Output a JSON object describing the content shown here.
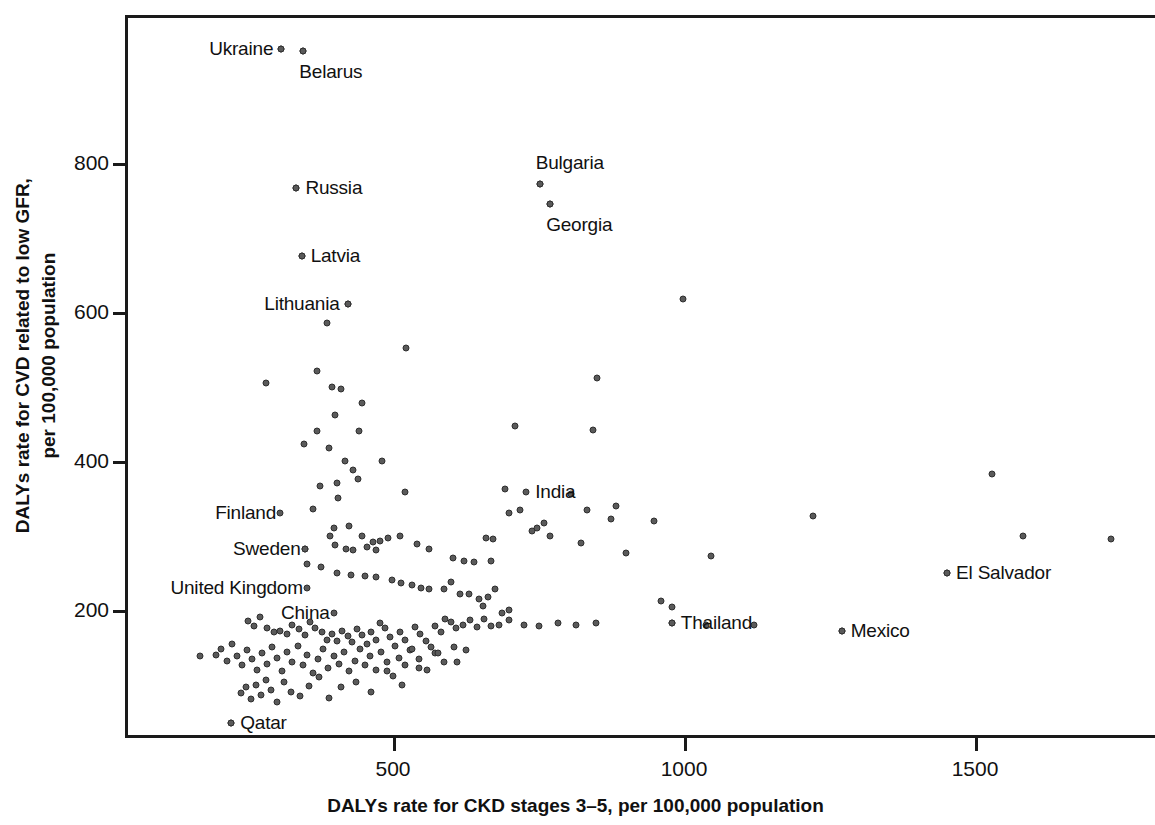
{
  "chart_data": {
    "type": "scatter",
    "title": "",
    "xlabel": "DALYs rate for CKD stages 3–5, per 100,000 population",
    "ylabel": "DALYs rate for CVD related to low GFR,\nper 100,000 population",
    "ylabel_line1": "DALYs rate for CVD related to low GFR,",
    "ylabel_line2": "per 100,000 population",
    "xlim": [
      60,
      1865
    ],
    "ylim": [
      20,
      990
    ],
    "xticks": [
      500,
      1000,
      1500
    ],
    "xtick_labels": [
      "500",
      "1000",
      "1500"
    ],
    "yticks": [
      200,
      400,
      600,
      800
    ],
    "ytick_labels": [
      "200",
      "400",
      "600",
      "800"
    ],
    "grid": false,
    "legend": "none",
    "marker_color": "#5a5a5a",
    "marker_edge_color": "#2e2e2e",
    "labeled_points": [
      {
        "name": "Ukraine",
        "x": 308,
        "y": 953,
        "label_side": "left"
      },
      {
        "name": "Belarus",
        "x": 346,
        "y": 950,
        "label_side": "below"
      },
      {
        "name": "Bulgaria",
        "x": 752,
        "y": 772,
        "label_side": "above"
      },
      {
        "name": "Georgia",
        "x": 770,
        "y": 745,
        "label_side": "below"
      },
      {
        "name": "Russia",
        "x": 334,
        "y": 766,
        "label_side": "right"
      },
      {
        "name": "Latvia",
        "x": 343,
        "y": 675,
        "label_side": "right"
      },
      {
        "name": "Lithuania",
        "x": 422,
        "y": 611,
        "label_side": "left"
      },
      {
        "name": "India",
        "x": 729,
        "y": 358,
        "label_side": "right"
      },
      {
        "name": "Finland",
        "x": 306,
        "y": 330,
        "label_side": "label-only"
      },
      {
        "name": "Sweden",
        "x": 348,
        "y": 282,
        "label_side": "label-only"
      },
      {
        "name": "United Kingdom",
        "x": 352,
        "y": 230,
        "label_side": "label-only"
      },
      {
        "name": "China",
        "x": 398,
        "y": 196,
        "label_side": "label-only"
      },
      {
        "name": "Qatar",
        "x": 222,
        "y": 48,
        "label_side": "right"
      },
      {
        "name": "El Salvador",
        "x": 1452,
        "y": 250,
        "label_side": "right"
      },
      {
        "name": "Thailand",
        "x": 979,
        "y": 183,
        "label_side": "right"
      },
      {
        "name": "Mexico",
        "x": 1271,
        "y": 172,
        "label_side": "right"
      }
    ],
    "points": [
      [
        308,
        953
      ],
      [
        346,
        950
      ],
      [
        334,
        766
      ],
      [
        752,
        772
      ],
      [
        770,
        745
      ],
      [
        343,
        675
      ],
      [
        422,
        611
      ],
      [
        387,
        585
      ],
      [
        999,
        617
      ],
      [
        523,
        552
      ],
      [
        281,
        505
      ],
      [
        370,
        521
      ],
      [
        395,
        500
      ],
      [
        410,
        497
      ],
      [
        400,
        462
      ],
      [
        446,
        478
      ],
      [
        442,
        440
      ],
      [
        369,
        440
      ],
      [
        851,
        512
      ],
      [
        710,
        447
      ],
      [
        347,
        423
      ],
      [
        390,
        418
      ],
      [
        417,
        400
      ],
      [
        481,
        400
      ],
      [
        431,
        388
      ],
      [
        440,
        376
      ],
      [
        403,
        370
      ],
      [
        375,
        366
      ],
      [
        406,
        350
      ],
      [
        520,
        359
      ],
      [
        843,
        442
      ],
      [
        1529,
        383
      ],
      [
        692,
        362
      ],
      [
        718,
        334
      ],
      [
        700,
        330
      ],
      [
        805,
        356
      ],
      [
        884,
        340
      ],
      [
        759,
        317
      ],
      [
        833,
        334
      ],
      [
        875,
        322
      ],
      [
        948,
        320
      ],
      [
        1221,
        326
      ],
      [
        1583,
        299
      ],
      [
        1733,
        295
      ],
      [
        363,
        335
      ],
      [
        398,
        310
      ],
      [
        424,
        313
      ],
      [
        391,
        300
      ],
      [
        446,
        300
      ],
      [
        465,
        291
      ],
      [
        478,
        292
      ],
      [
        456,
        285
      ],
      [
        400,
        287
      ],
      [
        419,
        282
      ],
      [
        432,
        280
      ],
      [
        470,
        280
      ],
      [
        492,
        297
      ],
      [
        512,
        300
      ],
      [
        541,
        288
      ],
      [
        561,
        282
      ],
      [
        603,
        270
      ],
      [
        622,
        266
      ],
      [
        640,
        264
      ],
      [
        668,
        266
      ],
      [
        660,
        297
      ],
      [
        672,
        295
      ],
      [
        738,
        306
      ],
      [
        747,
        310
      ],
      [
        770,
        300
      ],
      [
        823,
        290
      ],
      [
        900,
        277
      ],
      [
        1047,
        273
      ],
      [
        348,
        282
      ],
      [
        353,
        262
      ],
      [
        377,
        258
      ],
      [
        404,
        250
      ],
      [
        427,
        247
      ],
      [
        452,
        245
      ],
      [
        470,
        244
      ],
      [
        499,
        240
      ],
      [
        514,
        236
      ],
      [
        533,
        233
      ],
      [
        548,
        230
      ],
      [
        562,
        228
      ],
      [
        588,
        228
      ],
      [
        600,
        237
      ],
      [
        615,
        222
      ],
      [
        630,
        222
      ],
      [
        648,
        215
      ],
      [
        655,
        205
      ],
      [
        663,
        218
      ],
      [
        676,
        228
      ],
      [
        688,
        196
      ],
      [
        700,
        200
      ],
      [
        1452,
        250
      ],
      [
        960,
        212
      ],
      [
        980,
        204
      ],
      [
        250,
        185
      ],
      [
        262,
        178
      ],
      [
        272,
        190
      ],
      [
        283,
        176
      ],
      [
        295,
        170
      ],
      [
        305,
        172
      ],
      [
        318,
        168
      ],
      [
        327,
        180
      ],
      [
        338,
        175
      ],
      [
        349,
        167
      ],
      [
        357,
        184
      ],
      [
        366,
        176
      ],
      [
        378,
        170
      ],
      [
        386,
        160
      ],
      [
        395,
        168
      ],
      [
        404,
        158
      ],
      [
        413,
        172
      ],
      [
        422,
        165
      ],
      [
        430,
        157
      ],
      [
        438,
        174
      ],
      [
        447,
        166
      ],
      [
        456,
        155
      ],
      [
        463,
        170
      ],
      [
        470,
        160
      ],
      [
        478,
        182
      ],
      [
        487,
        176
      ],
      [
        495,
        164
      ],
      [
        504,
        152
      ],
      [
        512,
        170
      ],
      [
        521,
        160
      ],
      [
        530,
        146
      ],
      [
        538,
        177
      ],
      [
        547,
        168
      ],
      [
        556,
        158
      ],
      [
        565,
        150
      ],
      [
        573,
        178
      ],
      [
        582,
        170
      ],
      [
        590,
        188
      ],
      [
        600,
        184
      ],
      [
        608,
        176
      ],
      [
        620,
        180
      ],
      [
        632,
        186
      ],
      [
        645,
        177
      ],
      [
        657,
        188
      ],
      [
        669,
        178
      ],
      [
        682,
        180
      ],
      [
        700,
        186
      ],
      [
        725,
        180
      ],
      [
        750,
        178
      ],
      [
        783,
        183
      ],
      [
        815,
        180
      ],
      [
        848,
        182
      ],
      [
        979,
        183
      ],
      [
        1038,
        180
      ],
      [
        1120,
        180
      ],
      [
        1271,
        172
      ],
      [
        196,
        140
      ],
      [
        205,
        148
      ],
      [
        214,
        132
      ],
      [
        223,
        155
      ],
      [
        232,
        138
      ],
      [
        240,
        126
      ],
      [
        249,
        146
      ],
      [
        258,
        134
      ],
      [
        266,
        120
      ],
      [
        275,
        142
      ],
      [
        284,
        128
      ],
      [
        292,
        150
      ],
      [
        301,
        136
      ],
      [
        310,
        118
      ],
      [
        318,
        144
      ],
      [
        327,
        130
      ],
      [
        336,
        152
      ],
      [
        345,
        126
      ],
      [
        353,
        140
      ],
      [
        362,
        116
      ],
      [
        371,
        134
      ],
      [
        380,
        148
      ],
      [
        389,
        122
      ],
      [
        398,
        138
      ],
      [
        407,
        128
      ],
      [
        416,
        144
      ],
      [
        425,
        118
      ],
      [
        434,
        132
      ],
      [
        443,
        148
      ],
      [
        452,
        126
      ],
      [
        461,
        138
      ],
      [
        470,
        120
      ],
      [
        480,
        143
      ],
      [
        490,
        130
      ],
      [
        500,
        112
      ],
      [
        510,
        136
      ],
      [
        520,
        126
      ],
      [
        532,
        148
      ],
      [
        545,
        134
      ],
      [
        558,
        120
      ],
      [
        572,
        142
      ],
      [
        587,
        130
      ],
      [
        605,
        150
      ],
      [
        625,
        146
      ],
      [
        168,
        138
      ],
      [
        222,
        48
      ],
      [
        238,
        88
      ],
      [
        247,
        96
      ],
      [
        256,
        80
      ],
      [
        264,
        100
      ],
      [
        273,
        86
      ],
      [
        282,
        106
      ],
      [
        291,
        92
      ],
      [
        300,
        76
      ],
      [
        312,
        104
      ],
      [
        325,
        90
      ],
      [
        340,
        84
      ],
      [
        355,
        98
      ],
      [
        372,
        110
      ],
      [
        390,
        82
      ],
      [
        410,
        96
      ],
      [
        436,
        104
      ],
      [
        462,
        90
      ],
      [
        489,
        118
      ],
      [
        516,
        100
      ],
      [
        545,
        122
      ],
      [
        577,
        142
      ],
      [
        610,
        130
      ]
    ],
    "n_points": 213
  }
}
